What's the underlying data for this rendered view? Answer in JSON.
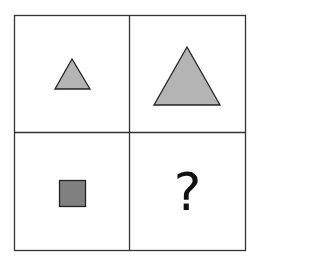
{
  "puzzle": {
    "grid": {
      "rows": 2,
      "cols": 2,
      "border_color": "#333333"
    },
    "cells": [
      {
        "position": "top-left",
        "shape": "triangle",
        "size": "small",
        "fill": "#b4b4b4"
      },
      {
        "position": "top-right",
        "shape": "triangle",
        "size": "large",
        "fill": "#b4b4b4"
      },
      {
        "position": "bottom-left",
        "shape": "square",
        "size": "small",
        "fill": "#808080"
      },
      {
        "position": "bottom-right",
        "content": "?"
      }
    ]
  }
}
